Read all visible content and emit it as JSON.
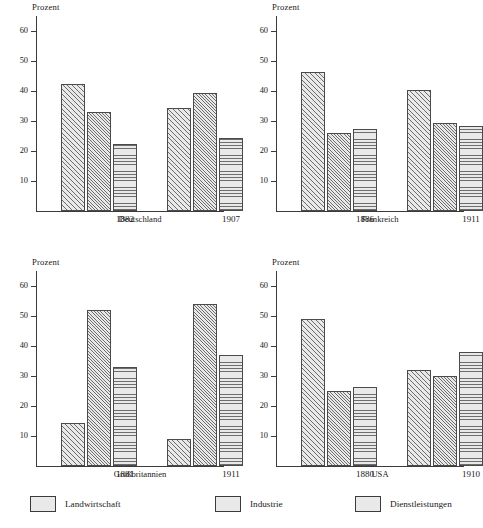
{
  "chart_data": {
    "type": "bar",
    "title": "",
    "ylabel": "Prozent",
    "xlabel": "",
    "ylim": [
      0,
      65
    ],
    "yticks": [
      10,
      20,
      30,
      40,
      50,
      60
    ],
    "grid": false,
    "legend_position": "bottom",
    "series": [
      {
        "name": "Landwirtschaft",
        "pattern": "diagonal-hatch"
      },
      {
        "name": "Industrie",
        "pattern": "dense-diagonal-hatch"
      },
      {
        "name": "Dienstleistungen",
        "pattern": "horizontal-lines"
      }
    ],
    "panels": [
      {
        "region": "Deutschland",
        "ylabel": "Prozent",
        "categories": [
          "1882",
          "1907"
        ],
        "groups": [
          {
            "label": "1882",
            "values": [
              42.5,
              33.0,
              22.5
            ]
          },
          {
            "label": "1907",
            "values": [
              34.5,
              39.5,
              24.5
            ]
          }
        ]
      },
      {
        "region": "Frankreich",
        "ylabel": "Prozent",
        "categories": [
          "1886",
          "1911"
        ],
        "groups": [
          {
            "label": "1886",
            "values": [
              46.5,
              26.0,
              27.5
            ]
          },
          {
            "label": "1911",
            "values": [
              40.5,
              29.5,
              28.5
            ]
          }
        ]
      },
      {
        "region": "Großbritannien",
        "ylabel": "Prozent",
        "categories": [
          "1881",
          "1911"
        ],
        "groups": [
          {
            "label": "1881",
            "values": [
              14.5,
              52.0,
              33.0
            ]
          },
          {
            "label": "1911",
            "values": [
              9.0,
              54.0,
              37.0
            ]
          }
        ]
      },
      {
        "region": "USA",
        "ylabel": "Prozent",
        "categories": [
          "1880",
          "1910"
        ],
        "groups": [
          {
            "label": "1880",
            "values": [
              49.0,
              25.0,
              26.5
            ]
          },
          {
            "label": "1910",
            "values": [
              32.0,
              30.0,
              38.0
            ]
          }
        ]
      }
    ]
  },
  "legend": {
    "items": [
      {
        "label": "Landwirtschaft"
      },
      {
        "label": "Industrie"
      },
      {
        "label": "Dienstleistungen"
      }
    ]
  },
  "colors": {
    "bar_fill": "#e9e9e9",
    "bar_stroke": "#4a4a4a",
    "hatch": "#6d6d6d",
    "axis": "#3b3b3b",
    "text": "#1a1a1a",
    "background": "#ffffff"
  }
}
